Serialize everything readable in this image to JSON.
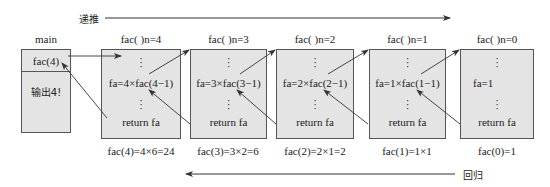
{
  "top_arrow": {
    "label": "递推"
  },
  "bottom_arrow": {
    "label": "回归"
  },
  "main_frame": {
    "title": "main",
    "call": "fac(4)",
    "output": "输出4!"
  },
  "frames": [
    {
      "title": "fac( )n=4",
      "vdots_top": "⋮",
      "expr": "fa=4×fac(4−1)",
      "vdots_bottom": "⋮",
      "ret": "return fa",
      "result": "fac(4)=4×6=24"
    },
    {
      "title": "fac( )n=3",
      "vdots_top": "⋮",
      "expr": "fa=3×fac(3−1)",
      "vdots_bottom": "⋮",
      "ret": "return fa",
      "result": "fac(3)=3×2=6"
    },
    {
      "title": "fac( )n=2",
      "vdots_top": "⋮",
      "expr": "fa=2×fac(2−1)",
      "vdots_bottom": "⋮",
      "ret": "return fa",
      "result": "fac(2)=2×1=2"
    },
    {
      "title": "fac( )n=1",
      "vdots_top": "⋮",
      "expr": "fa=1×fac(1−1)",
      "vdots_bottom": "⋮",
      "ret": "return fa",
      "result": "fac(1)=1×1"
    },
    {
      "title": "fac( )n=0",
      "vdots_top": "⋮",
      "expr": "fa=1",
      "vdots_bottom": "⋮",
      "ret": "return fa",
      "result": "fac(0)=1"
    }
  ],
  "colors": {
    "box_fill": "#e4e4e4",
    "box_border": "#555555",
    "line": "#333333"
  }
}
